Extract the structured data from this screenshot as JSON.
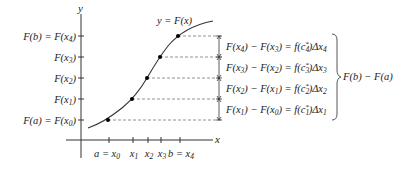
{
  "diagram": {
    "axes": {
      "x_label": "x",
      "y_label": "y"
    },
    "curve_label": "y = F(x)",
    "y_ticks": [
      {
        "label": "F(b) = F(x4)",
        "main": "F(b) = F(x",
        "sub": "4",
        "tail": ")"
      },
      {
        "label": "F(x3)",
        "main": "F(x",
        "sub": "3",
        "tail": ")"
      },
      {
        "label": "F(x2)",
        "main": "F(x",
        "sub": "2",
        "tail": ")"
      },
      {
        "label": "F(x1)",
        "main": "F(x",
        "sub": "1",
        "tail": ")"
      },
      {
        "label": "F(a) = F(x0)",
        "main": "F(a) = F(x",
        "sub": "0",
        "tail": ")"
      }
    ],
    "x_ticks": [
      {
        "label": "a = x0",
        "main": "a = x",
        "sub": "0"
      },
      {
        "label": "x1",
        "main": "x",
        "sub": "1"
      },
      {
        "label": "x2",
        "main": "x",
        "sub": "2"
      },
      {
        "label": "x3",
        "main": "x",
        "sub": "3"
      },
      {
        "label": "b = x4",
        "main": "b = x",
        "sub": "4"
      }
    ],
    "equations": [
      "F(x4) − F(x3) = f(c4*)Δx4",
      "F(x3) − F(x2) = f(c3*)Δx3",
      "F(x2) − F(x1) = f(c2*)Δx2",
      "F(x1) − F(x0) = f(c1*)Δx1"
    ],
    "equation_parts": [
      {
        "a": "4",
        "b": "3",
        "c": "4",
        "d": "4"
      },
      {
        "a": "3",
        "b": "2",
        "c": "3",
        "d": "3"
      },
      {
        "a": "2",
        "b": "1",
        "c": "2",
        "d": "2"
      },
      {
        "a": "1",
        "b": "0",
        "c": "1",
        "d": "1"
      }
    ],
    "brace_label": "F(b) − F(a)"
  }
}
